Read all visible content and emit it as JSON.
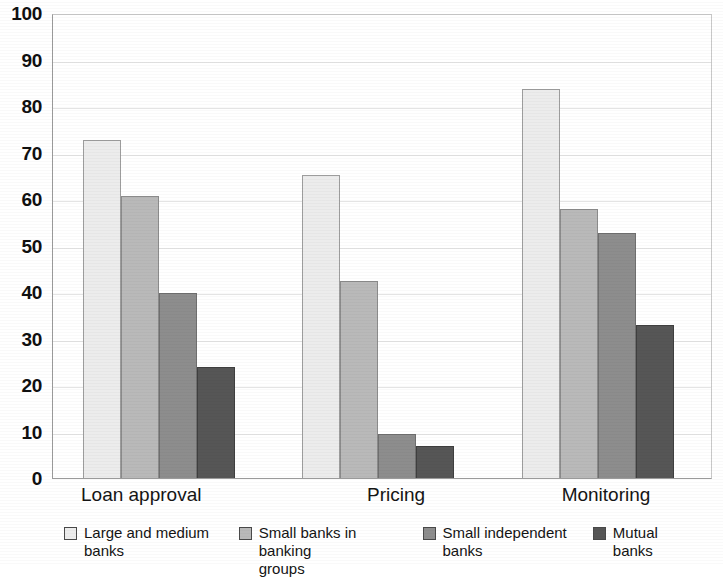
{
  "chart_data": {
    "type": "bar",
    "title": "",
    "subtitle": "",
    "xlabel": "",
    "ylabel": "",
    "ylim": [
      0,
      100
    ],
    "ytick_step": 10,
    "yticks": [
      100,
      90,
      80,
      70,
      60,
      50,
      40,
      30,
      20,
      10,
      0
    ],
    "grid": true,
    "grid_axis": "y",
    "legend_position": "bottom",
    "categories": [
      "Loan approval",
      "Pricing",
      "Monitoring"
    ],
    "series": [
      {
        "name": "Large and medium banks",
        "color": "#ececec",
        "values": [
          73,
          65.5,
          84
        ]
      },
      {
        "name": "Small banks in banking groups",
        "color": "#b9b9b9",
        "values": [
          61,
          42.5,
          58
        ]
      },
      {
        "name": "Small independent banks",
        "color": "#8d8d8d",
        "values": [
          40,
          9.5,
          53
        ]
      },
      {
        "name": "Mutual banks",
        "color": "#565656",
        "values": [
          24,
          7,
          33
        ]
      }
    ]
  },
  "legend": {
    "items": [
      {
        "label_line1": "Large and medium",
        "label_line2": "banks"
      },
      {
        "label_line1": "Small banks in banking",
        "label_line2": "groups"
      },
      {
        "label_line1": "Small independent",
        "label_line2": "banks"
      },
      {
        "label_line1": "Mutual banks",
        "label_line2": ""
      }
    ]
  }
}
